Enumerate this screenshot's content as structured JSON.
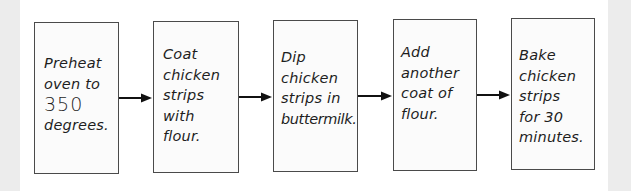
{
  "diagram": {
    "type": "flowchart",
    "direction": "left-to-right",
    "steps": [
      {
        "id": 1,
        "lines": [
          "Preheat",
          "oven to",
          "350",
          "degrees."
        ],
        "text": "Preheat oven to 350 degrees."
      },
      {
        "id": 2,
        "lines": [
          "Coat",
          "chicken",
          "strips",
          "with",
          "flour."
        ],
        "text": "Coat chicken strips with flour."
      },
      {
        "id": 3,
        "lines": [
          "Dip",
          "chicken",
          "strips in",
          "buttermilk."
        ],
        "text": "Dip chicken strips in buttermilk."
      },
      {
        "id": 4,
        "lines": [
          "Add",
          "another",
          "coat of",
          "flour."
        ],
        "text": "Add another coat of flour."
      },
      {
        "id": 5,
        "lines": [
          "Bake",
          "chicken",
          "strips",
          "for 30",
          "minutes."
        ],
        "text": "Bake chicken strips for 30 minutes."
      }
    ],
    "connectors": [
      {
        "from": 1,
        "to": 2,
        "icon": "arrow-right-icon"
      },
      {
        "from": 2,
        "to": 3,
        "icon": "arrow-right-icon"
      },
      {
        "from": 3,
        "to": 4,
        "icon": "arrow-right-icon"
      },
      {
        "from": 4,
        "to": 5,
        "icon": "arrow-right-icon"
      }
    ],
    "colors": {
      "border": "#4a4a4a",
      "text": "#1e1e1e",
      "arrow": "#111111",
      "background": "#ffffff",
      "margin": "#ececec"
    }
  }
}
